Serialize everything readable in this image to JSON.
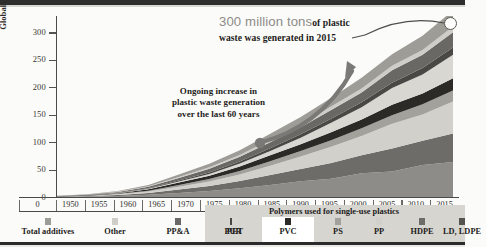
{
  "chart_data": {
    "type": "area",
    "title": "",
    "xlabel": "",
    "ylabel": "Global primary plastic waste generation (million tons)",
    "xlim": [
      1950,
      2015
    ],
    "ylim": [
      0,
      330
    ],
    "ytick_labels": [
      "0",
      "50",
      "100",
      "150",
      "200",
      "250",
      "300"
    ],
    "ytick_values": [
      0,
      50,
      100,
      150,
      200,
      250,
      300
    ],
    "xtick_labels": [
      "1950",
      "1955",
      "1960",
      "1965",
      "1970",
      "1975",
      "1980",
      "1985",
      "1990",
      "1995",
      "2000",
      "2005",
      "2010",
      "2015"
    ],
    "xtick_values": [
      1950,
      1955,
      1960,
      1965,
      1970,
      1975,
      1980,
      1985,
      1990,
      1995,
      2000,
      2005,
      2010,
      2015
    ],
    "x": [
      1950,
      1955,
      1960,
      1965,
      1970,
      1975,
      1980,
      1985,
      1990,
      1995,
      2000,
      2005,
      2010,
      2015
    ],
    "stacked": true,
    "grid": false,
    "legend_position": "bottom",
    "series": [
      {
        "name": "LD, LDPE",
        "color": "#8e8c88",
        "values": [
          0.4,
          0.9,
          2.0,
          4.0,
          7.5,
          11.0,
          16.0,
          22.0,
          28.0,
          34.0,
          42.0,
          49.0,
          56.0,
          64.0
        ]
      },
      {
        "name": "HDPE",
        "color": "#6e6c68",
        "values": [
          0.3,
          0.7,
          1.6,
          3.2,
          6.0,
          9.0,
          13.0,
          18.0,
          23.0,
          28.0,
          34.0,
          40.0,
          46.0,
          52.0
        ]
      },
      {
        "name": "PP",
        "color": "#d2d0cb",
        "values": [
          0.2,
          0.5,
          1.2,
          2.6,
          5.2,
          8.0,
          12.0,
          17.0,
          23.0,
          29.0,
          36.0,
          43.0,
          50.0,
          58.0
        ]
      },
      {
        "name": "PS",
        "color": "#a3a19c",
        "values": [
          0.2,
          0.4,
          0.9,
          1.8,
          3.2,
          4.6,
          6.4,
          8.2,
          10.0,
          12.0,
          14.0,
          16.0,
          18.0,
          20.0
        ]
      },
      {
        "name": "PVC",
        "color": "#2b2a27",
        "values": [
          0.3,
          0.6,
          1.3,
          2.5,
          4.4,
          6.2,
          8.4,
          10.5,
          12.5,
          14.5,
          16.5,
          18.5,
          20.5,
          22.5
        ]
      },
      {
        "name": "PET",
        "color": "#d9d7d2",
        "values": [
          0.0,
          0.1,
          0.3,
          0.8,
          1.8,
          3.2,
          5.2,
          8.0,
          12.0,
          17.0,
          23.0,
          29.0,
          36.0,
          43.0
        ]
      },
      {
        "name": "PUR",
        "color": "#4a4845",
        "values": [
          0.1,
          0.2,
          0.5,
          1.0,
          1.9,
          2.8,
          3.8,
          5.0,
          6.2,
          7.4,
          8.8,
          10.2,
          11.6,
          13.0
        ]
      },
      {
        "name": "PP&A",
        "color": "#6a6864",
        "values": [
          0.3,
          0.7,
          1.5,
          2.8,
          4.8,
          6.6,
          8.6,
          10.8,
          13.0,
          15.5,
          18.5,
          21.5,
          25.0,
          28.0
        ]
      },
      {
        "name": "Other",
        "color": "#cfcdc8",
        "values": [
          0.1,
          0.2,
          0.5,
          1.0,
          1.8,
          2.6,
          3.4,
          4.3,
          5.2,
          6.2,
          7.2,
          8.2,
          9.2,
          10.5
        ]
      },
      {
        "name": "Total additives",
        "color": "#9e9c97",
        "values": [
          0.2,
          0.5,
          1.2,
          2.4,
          4.4,
          6.4,
          8.6,
          11.0,
          13.5,
          16.0,
          19.0,
          22.0,
          25.0,
          29.0
        ]
      }
    ],
    "annotations": [
      {
        "id": "peak-callout",
        "big": "300 million tons",
        "small": "of plastic waste was generated in 2015",
        "points_to_year": 2015,
        "points_to_value": 300
      },
      {
        "id": "trend-callout",
        "text": "Ongoing increase in plastic waste generation over the last 60 years"
      }
    ]
  },
  "axis": {
    "y_title": "Global primary plastic waste generation (million tons)",
    "y_labels": [
      "300",
      "250",
      "200",
      "150",
      "100",
      "50",
      "0"
    ],
    "x_origin_label": "0",
    "x_labels": [
      "1950",
      "1955",
      "1960",
      "1965",
      "1970",
      "1975",
      "1980",
      "1985",
      "1990",
      "1995",
      "2000",
      "2005",
      "2010",
      "2015"
    ]
  },
  "annotation_peak": {
    "big": "300 million tons",
    "small": "of plastic waste was generated in 2015"
  },
  "annotation_trend": {
    "line1": "Ongoing increase in",
    "line2": "plastic waste generation",
    "line3": "over the last 60 years"
  },
  "legend": {
    "single_use_band_label": "Polymers used for single-use plastics",
    "items": [
      {
        "label": "Total additives",
        "color": "#9e9c97",
        "highlighted": false
      },
      {
        "label": "Other",
        "color": "#cfcdc8",
        "highlighted": false
      },
      {
        "label": "PP&A",
        "color": "#6a6864",
        "highlighted": false
      },
      {
        "label": "PUR",
        "color": "#4a4845",
        "highlighted": false
      },
      {
        "label": "PET",
        "color": "#d9d7d2",
        "highlighted": false
      },
      {
        "label": "PVC",
        "color": "#2b2a27",
        "highlighted": true
      },
      {
        "label": "PS",
        "color": "#a3a19c",
        "highlighted": false
      },
      {
        "label": "PP",
        "color": "#d2d0cb",
        "highlighted": false
      },
      {
        "label": "HDPE",
        "color": "#6e6c68",
        "highlighted": false
      },
      {
        "label": "LD, LDPE",
        "color": "#56544f",
        "highlighted": false
      }
    ]
  }
}
